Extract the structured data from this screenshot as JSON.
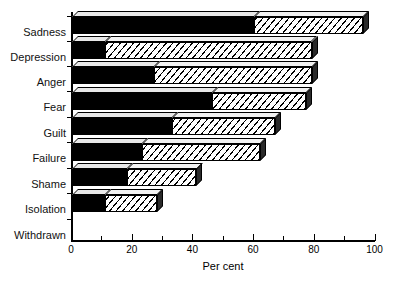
{
  "chart_data": {
    "type": "bar",
    "orientation": "horizontal",
    "stacked": true,
    "title": "",
    "xlabel": "Per cent",
    "ylabel": "",
    "xlim": [
      0,
      100
    ],
    "xticks": [
      0,
      20,
      40,
      60,
      80,
      100
    ],
    "xtick_labels": [
      "0",
      "20",
      "40",
      "60",
      "80",
      "100"
    ],
    "minor_xticks": [
      10,
      30,
      50,
      70,
      90
    ],
    "grid": false,
    "legend": "none",
    "categories": [
      "Sadness",
      "Depression",
      "Anger",
      "Fear",
      "Guilt",
      "Failure",
      "Shame",
      "Isolation",
      "Withdrawn"
    ],
    "series": [
      {
        "name": "segment-1",
        "fill": "solid-black",
        "values": [
          60,
          11,
          27,
          46,
          33,
          23,
          18,
          11,
          0
        ]
      },
      {
        "name": "segment-2",
        "fill": "diagonal-hatch",
        "values": [
          36,
          68,
          52,
          31,
          34,
          39,
          23,
          17,
          0
        ]
      }
    ],
    "totals": [
      96,
      79,
      79,
      77,
      67,
      62,
      41,
      28,
      0
    ]
  },
  "axis": {
    "x_title": "Per cent",
    "x_tick_labels": [
      "0",
      "20",
      "40",
      "60",
      "80",
      "100"
    ]
  },
  "categories": {
    "items": [
      {
        "label": "Sadness"
      },
      {
        "label": "Depression"
      },
      {
        "label": "Anger"
      },
      {
        "label": "Fear"
      },
      {
        "label": "Guilt"
      },
      {
        "label": "Failure"
      },
      {
        "label": "Shame"
      },
      {
        "label": "Isolation"
      },
      {
        "label": "Withdrawn"
      }
    ]
  },
  "colors": {
    "segment_1": "#000000",
    "segment_2_background": "#ffffff",
    "segment_2_hatch": "#000000",
    "axis": "#000000",
    "page_background": "#ffffff"
  }
}
